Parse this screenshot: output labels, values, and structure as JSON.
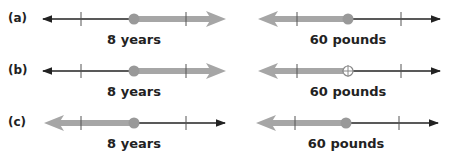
{
  "rows": [
    {
      "label": "(a)",
      "left": {
        "caption": "8 years",
        "point": "closed",
        "direction": "right"
      },
      "right": {
        "caption": "60 pounds",
        "point": "closed",
        "direction": "left"
      }
    },
    {
      "label": "(b)",
      "left": {
        "caption": "8 years",
        "point": "closed",
        "direction": "right"
      },
      "right": {
        "caption": "60 pounds",
        "point": "open-cross",
        "direction": "left"
      }
    },
    {
      "label": "(c)",
      "left": {
        "caption": "8 years",
        "point": "closed",
        "direction": "left"
      },
      "right": {
        "caption": "60 pounds",
        "point": "closed",
        "direction": "left"
      }
    }
  ],
  "colors": {
    "line": "#222222",
    "shade": "#a6a6a6",
    "point": "#999999"
  }
}
